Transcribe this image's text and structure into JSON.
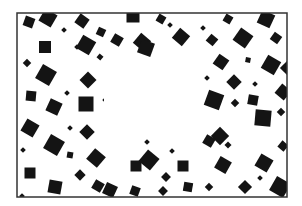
{
  "figure": {
    "kind": "illusory-contour-pattern",
    "background": "#ffffff",
    "ink": "#141414",
    "frame": {
      "x": 17,
      "y": 13,
      "w": 270,
      "h": 184,
      "stroke": "#333333",
      "stroke_width": 1.5
    },
    "illusory_rect": {
      "x": 104,
      "y": 62,
      "w": 96,
      "h": 76
    },
    "squares": [
      {
        "cx": 29,
        "cy": 22,
        "s": 10,
        "r": 20
      },
      {
        "cx": 48,
        "cy": 18,
        "s": 14,
        "r": 30,
        "occluded": true
      },
      {
        "cx": 82,
        "cy": 21,
        "s": 11,
        "r": 35
      },
      {
        "cx": 64,
        "cy": 30,
        "s": 4,
        "r": 45
      },
      {
        "cx": 101,
        "cy": 32,
        "s": 8,
        "r": 25
      },
      {
        "cx": 117,
        "cy": 40,
        "s": 10,
        "r": 30
      },
      {
        "cx": 133,
        "cy": 16,
        "s": 13,
        "r": 0
      },
      {
        "cx": 142,
        "cy": 42,
        "s": 13,
        "r": 40
      },
      {
        "cx": 146,
        "cy": 48,
        "s": 14,
        "r": 20
      },
      {
        "cx": 161,
        "cy": 19,
        "s": 8,
        "r": 30
      },
      {
        "cx": 170,
        "cy": 25,
        "s": 4,
        "r": 45
      },
      {
        "cx": 181,
        "cy": 37,
        "s": 13,
        "r": 40
      },
      {
        "cx": 203,
        "cy": 28,
        "s": 4,
        "r": 45
      },
      {
        "cx": 228,
        "cy": 19,
        "s": 8,
        "r": 30
      },
      {
        "cx": 243,
        "cy": 38,
        "s": 15,
        "r": 35
      },
      {
        "cx": 266,
        "cy": 19,
        "s": 14,
        "r": 25
      },
      {
        "cx": 248,
        "cy": 60,
        "s": 5,
        "r": 10
      },
      {
        "cx": 212,
        "cy": 40,
        "s": 9,
        "r": 40
      },
      {
        "cx": 276,
        "cy": 38,
        "s": 9,
        "r": 35
      },
      {
        "cx": 271,
        "cy": 65,
        "s": 15,
        "r": 30
      },
      {
        "cx": 221,
        "cy": 62,
        "s": 12,
        "r": 35
      },
      {
        "cx": 45,
        "cy": 47,
        "s": 12,
        "r": 0
      },
      {
        "cx": 27,
        "cy": 63,
        "s": 6,
        "r": 45
      },
      {
        "cx": 77,
        "cy": 47,
        "s": 4,
        "r": 45
      },
      {
        "cx": 86,
        "cy": 45,
        "s": 15,
        "r": 30
      },
      {
        "cx": 100,
        "cy": 57,
        "s": 5,
        "r": 40
      },
      {
        "cx": 46,
        "cy": 75,
        "s": 16,
        "r": 30
      },
      {
        "cx": 67,
        "cy": 93,
        "s": 4,
        "r": 45
      },
      {
        "cx": 88,
        "cy": 80,
        "s": 12,
        "r": 45
      },
      {
        "cx": 31,
        "cy": 96,
        "s": 10,
        "r": 5
      },
      {
        "cx": 54,
        "cy": 107,
        "s": 13,
        "r": 25
      },
      {
        "cx": 86,
        "cy": 104,
        "s": 15,
        "r": 0
      },
      {
        "cx": 30,
        "cy": 128,
        "s": 14,
        "r": 30
      },
      {
        "cx": 70,
        "cy": 128,
        "s": 4,
        "r": 45
      },
      {
        "cx": 87,
        "cy": 132,
        "s": 11,
        "r": 45
      },
      {
        "cx": 110,
        "cy": 100,
        "s": 11,
        "r": 45
      },
      {
        "cx": 124,
        "cy": 105,
        "s": 12,
        "r": 5
      },
      {
        "cx": 123,
        "cy": 78,
        "s": 8,
        "r": 45
      },
      {
        "cx": 144,
        "cy": 88,
        "s": 16,
        "r": 35
      },
      {
        "cx": 172,
        "cy": 88,
        "s": 14,
        "r": 25
      },
      {
        "cx": 152,
        "cy": 112,
        "s": 11,
        "r": 45
      },
      {
        "cx": 182,
        "cy": 113,
        "s": 17,
        "r": 30
      },
      {
        "cx": 154,
        "cy": 76,
        "s": 5,
        "r": 45
      },
      {
        "cx": 207,
        "cy": 78,
        "s": 4,
        "r": 45
      },
      {
        "cx": 234,
        "cy": 82,
        "s": 11,
        "r": 45
      },
      {
        "cx": 255,
        "cy": 84,
        "s": 4,
        "r": 45
      },
      {
        "cx": 214,
        "cy": 100,
        "s": 16,
        "r": 20
      },
      {
        "cx": 235,
        "cy": 103,
        "s": 6,
        "r": 45
      },
      {
        "cx": 253,
        "cy": 100,
        "s": 10,
        "r": 10
      },
      {
        "cx": 263,
        "cy": 118,
        "s": 16,
        "r": 5
      },
      {
        "cx": 281,
        "cy": 112,
        "s": 6,
        "r": 45
      },
      {
        "cx": 283,
        "cy": 92,
        "s": 12,
        "r": 40
      },
      {
        "cx": 220,
        "cy": 136,
        "s": 13,
        "r": 45
      },
      {
        "cx": 119,
        "cy": 128,
        "s": 11,
        "r": 45
      },
      {
        "cx": 147,
        "cy": 142,
        "s": 4,
        "r": 45
      },
      {
        "cx": 209,
        "cy": 141,
        "s": 10,
        "r": 30
      },
      {
        "cx": 54,
        "cy": 145,
        "s": 16,
        "r": 30
      },
      {
        "cx": 70,
        "cy": 155,
        "s": 6,
        "r": 10
      },
      {
        "cx": 96,
        "cy": 158,
        "s": 14,
        "r": 40
      },
      {
        "cx": 23,
        "cy": 150,
        "s": 4,
        "r": 45
      },
      {
        "cx": 30,
        "cy": 173,
        "s": 11,
        "r": 0
      },
      {
        "cx": 80,
        "cy": 175,
        "s": 8,
        "r": 45
      },
      {
        "cx": 98,
        "cy": 186,
        "s": 10,
        "r": 30
      },
      {
        "cx": 55,
        "cy": 187,
        "s": 13,
        "r": 10
      },
      {
        "cx": 22,
        "cy": 196,
        "s": 4,
        "r": 45
      },
      {
        "cx": 136,
        "cy": 166,
        "s": 11,
        "r": 0
      },
      {
        "cx": 149,
        "cy": 160,
        "s": 15,
        "r": 40
      },
      {
        "cx": 166,
        "cy": 177,
        "s": 7,
        "r": 45
      },
      {
        "cx": 183,
        "cy": 166,
        "s": 11,
        "r": 0
      },
      {
        "cx": 172,
        "cy": 151,
        "s": 4,
        "r": 45
      },
      {
        "cx": 110,
        "cy": 190,
        "s": 12,
        "r": 25
      },
      {
        "cx": 135,
        "cy": 191,
        "s": 9,
        "r": 20
      },
      {
        "cx": 163,
        "cy": 191,
        "s": 7,
        "r": 45
      },
      {
        "cx": 188,
        "cy": 187,
        "s": 9,
        "r": 10
      },
      {
        "cx": 223,
        "cy": 165,
        "s": 13,
        "r": 30
      },
      {
        "cx": 245,
        "cy": 187,
        "s": 10,
        "r": 45
      },
      {
        "cx": 264,
        "cy": 163,
        "s": 14,
        "r": 30
      },
      {
        "cx": 260,
        "cy": 178,
        "s": 4,
        "r": 45
      },
      {
        "cx": 228,
        "cy": 145,
        "s": 5,
        "r": 45
      },
      {
        "cx": 283,
        "cy": 146,
        "s": 8,
        "r": 40
      },
      {
        "cx": 280,
        "cy": 187,
        "s": 16,
        "r": 30
      },
      {
        "cx": 209,
        "cy": 187,
        "s": 6,
        "r": 45
      },
      {
        "cx": 287,
        "cy": 68,
        "s": 10,
        "r": 45
      }
    ]
  }
}
